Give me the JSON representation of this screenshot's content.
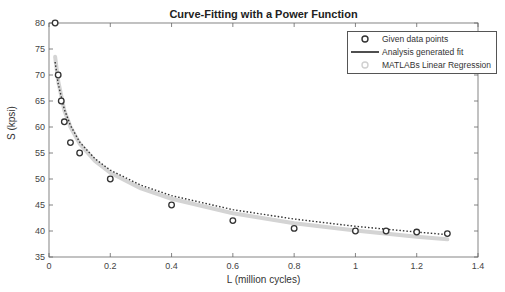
{
  "chart_data": {
    "type": "line",
    "title": "Curve-Fitting with a Power Function",
    "xlabel": "L (million cycles)",
    "ylabel": "S (kpsi)",
    "xlim": [
      0,
      1.4
    ],
    "ylim": [
      35,
      80
    ],
    "x_ticks": [
      "0",
      "0.2",
      "0.4",
      "0.6",
      "0.8",
      "1",
      "1.2",
      "1.4"
    ],
    "y_ticks": [
      "35",
      "40",
      "45",
      "50",
      "55",
      "60",
      "65",
      "70",
      "75",
      "80"
    ],
    "grid": false,
    "legend_position": "upper right",
    "series": [
      {
        "name": "Given data points",
        "style": "markers-circle",
        "x": [
          0.02,
          0.03,
          0.04,
          0.05,
          0.07,
          0.1,
          0.2,
          0.4,
          0.6,
          0.8,
          1.0,
          1.1,
          1.2,
          1.3
        ],
        "y": [
          80,
          70,
          65,
          61,
          57,
          55,
          50,
          45,
          42,
          40.5,
          40,
          40,
          39.8,
          39.5
        ]
      },
      {
        "name": "Analysis generated fit",
        "style": "solid-line",
        "x": [
          0.02,
          0.03,
          0.05,
          0.07,
          0.1,
          0.15,
          0.2,
          0.3,
          0.4,
          0.6,
          0.8,
          1.0,
          1.2,
          1.3
        ],
        "y": [
          72.5,
          68.3,
          63.4,
          60.3,
          57.1,
          53.9,
          51.7,
          48.8,
          46.8,
          44.1,
          42.3,
          40.9,
          39.8,
          39.3
        ]
      },
      {
        "name": "MATLABs Linear Regression",
        "style": "light-gray-markers",
        "x": [
          0.02,
          0.03,
          0.05,
          0.07,
          0.1,
          0.15,
          0.2,
          0.3,
          0.4,
          0.6,
          0.8,
          1.0,
          1.2,
          1.3
        ],
        "y": [
          73.5,
          68.8,
          63.2,
          60.0,
          56.8,
          53.5,
          51.2,
          48.2,
          46.2,
          43.4,
          41.5,
          40.1,
          38.9,
          38.4
        ]
      }
    ]
  },
  "legend": {
    "items": [
      {
        "label": "Given data points",
        "symbol": "circle-marker"
      },
      {
        "label": "Analysis generated fit",
        "symbol": "solid-line"
      },
      {
        "label": "MATLABs Linear Regression",
        "symbol": "light-circle-marker"
      }
    ]
  },
  "colors": {
    "data_points": "#333333",
    "fit_line": "#222222",
    "regression": "#c8c8c8",
    "axes": "#555555"
  }
}
